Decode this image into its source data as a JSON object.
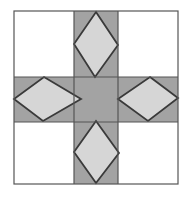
{
  "figure": {
    "canvas": {
      "width": 191,
      "height": 197,
      "background": "#ffffff"
    },
    "colors": {
      "background": "#ffffff",
      "corner_fill": "#ffffff",
      "cross_fill": "#a3a3a3",
      "center_fill": "#a3a3a3",
      "diamond_fill": "#d6d6d6",
      "outline": "#3a3a3a",
      "frame_stroke": "#555555"
    },
    "stroke_widths": {
      "frame": 1.2,
      "grid": 1.2,
      "diamond": 1.8
    },
    "frame": {
      "x": 14,
      "y": 11,
      "width": 164,
      "height": 173
    },
    "grid": {
      "columns": [
        {
          "name": "left",
          "x": 14,
          "width": 60
        },
        {
          "name": "middle",
          "x": 74,
          "width": 44
        },
        {
          "name": "right",
          "x": 118,
          "width": 60
        }
      ],
      "rows": [
        {
          "name": "top",
          "y": 11,
          "height": 66
        },
        {
          "name": "middle",
          "y": 77,
          "height": 45
        },
        {
          "name": "bottom",
          "y": 122,
          "height": 62
        }
      ]
    },
    "cells": [
      {
        "name": "top-left",
        "fill": "#ffffff",
        "shape": "none"
      },
      {
        "name": "top-center",
        "fill": "#a3a3a3",
        "shape": "diamond"
      },
      {
        "name": "top-right",
        "fill": "#ffffff",
        "shape": "none"
      },
      {
        "name": "middle-left",
        "fill": "#a3a3a3",
        "shape": "diamond"
      },
      {
        "name": "center",
        "fill": "#a3a3a3",
        "shape": "none"
      },
      {
        "name": "middle-right",
        "fill": "#a3a3a3",
        "shape": "diamond"
      },
      {
        "name": "bottom-left",
        "fill": "#ffffff",
        "shape": "none"
      },
      {
        "name": "bottom-center",
        "fill": "#a3a3a3",
        "shape": "diamond"
      },
      {
        "name": "bottom-right",
        "fill": "#ffffff",
        "shape": "none"
      }
    ],
    "shapes": {
      "cross_path": "M74,11 L118,11 L118,77 L178,77 L178,122 L118,122 L118,184 L74,184 L74,122 L14,122 L14,77 L74,77 Z",
      "center_square": {
        "x": 74,
        "y": 77,
        "width": 44,
        "height": 45
      },
      "diamond_top": "96,12 118,45 95,77 74,44",
      "diamond_bottom": "96,121 119,153 96,183 74,152",
      "diamond_left": "44,77 81,99 43,121 14,99",
      "diamond_right": "150,77 178,98 148,121 118,99"
    }
  }
}
